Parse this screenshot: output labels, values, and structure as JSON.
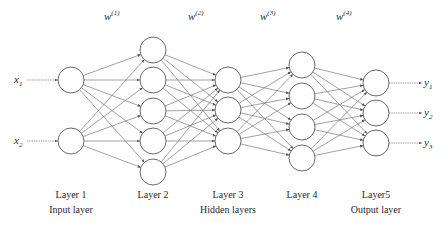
{
  "diagram": {
    "node_radius": 13,
    "colors": {
      "stroke": "#6b6b6b",
      "edge": "#7a7a7a",
      "text": "#2a2a2a",
      "background": "#ffffff"
    },
    "layers": [
      {
        "name": "Layer 1",
        "role": "Input layer",
        "x": 71,
        "nodes_y": [
          80,
          141
        ]
      },
      {
        "name": "Layer 2",
        "role": "",
        "x": 153,
        "nodes_y": [
          50,
          80,
          111,
          141,
          172
        ]
      },
      {
        "name": "Layer 3",
        "role": "Hidden layers",
        "x": 228,
        "nodes_y": [
          80,
          110,
          141
        ]
      },
      {
        "name": "Layer 4",
        "role": "",
        "x": 302,
        "nodes_y": [
          65,
          96,
          127,
          158
        ]
      },
      {
        "name": "Layer5",
        "role": "Output layer",
        "x": 376,
        "nodes_y": [
          83,
          113,
          143
        ]
      }
    ],
    "weights": [
      {
        "base": "w",
        "sup": "(1)",
        "x": 104,
        "y": 20
      },
      {
        "base": "w",
        "sup": "(2)",
        "x": 188,
        "y": 20
      },
      {
        "base": "w",
        "sup": "(3)",
        "x": 260,
        "y": 20
      },
      {
        "base": "w",
        "sup": "(4)",
        "x": 336,
        "y": 20
      }
    ],
    "inputs": [
      {
        "base": "x",
        "sub": "1",
        "y": 80
      },
      {
        "base": "x",
        "sub": "2",
        "y": 141
      }
    ],
    "outputs": [
      {
        "base": "y",
        "sub": "1",
        "y": 83
      },
      {
        "base": "y",
        "sub": "2",
        "y": 113
      },
      {
        "base": "y",
        "sub": "3",
        "y": 143
      }
    ],
    "layer_label_y": 198,
    "role_label_y": 213
  }
}
